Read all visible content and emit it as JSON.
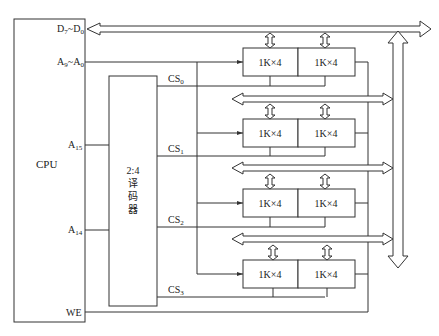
{
  "cpu": {
    "label": "CPU",
    "pins": {
      "data_bus": {
        "main": "D",
        "sub1": "7",
        "sep": "~D",
        "sub2": "0"
      },
      "addr_bus": {
        "main": "A",
        "sub1": "9",
        "sep": "~A",
        "sub2": "0"
      },
      "a15": {
        "main": "A",
        "sub": "15"
      },
      "a14": {
        "main": "A",
        "sub": "14"
      },
      "we": "WE"
    }
  },
  "decoder": {
    "lines": [
      "2:4",
      "译",
      "码",
      "器"
    ],
    "outputs": [
      {
        "main": "CS",
        "sub": "0"
      },
      {
        "main": "CS",
        "sub": "1"
      },
      {
        "main": "CS",
        "sub": "2"
      },
      {
        "main": "CS",
        "sub": "3"
      }
    ]
  },
  "memory_groups": [
    {
      "chips": [
        "1K×4",
        "1K×4"
      ]
    },
    {
      "chips": [
        "1K×4",
        "1K×4"
      ]
    },
    {
      "chips": [
        "1K×4",
        "1K×4"
      ]
    },
    {
      "chips": [
        "1K×4",
        "1K×4"
      ]
    }
  ],
  "colors": {
    "line": "#333333",
    "background": "#ffffff"
  }
}
